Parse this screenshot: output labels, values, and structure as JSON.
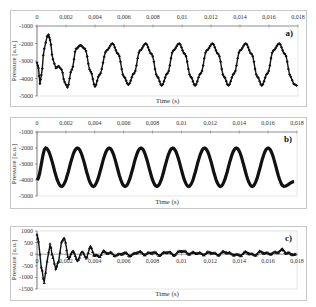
{
  "chart_data": [
    {
      "type": "line",
      "panel_label": "a)",
      "xlabel": "Time (s)",
      "ylabel": "Pressure [a.u.]",
      "xlim": [
        0,
        0.018
      ],
      "ylim": [
        -5000,
        -1000
      ],
      "x_ticks": [
        "0",
        "0,002",
        "0,004",
        "0,006",
        "0,008",
        "0,01",
        "0,012",
        "0,014",
        "0,016",
        "0,018"
      ],
      "y_ticks": [
        "-1000",
        "-2000",
        "-3000",
        "-4000",
        "-5000"
      ],
      "x_axis_position": "top",
      "grid": false,
      "marker": "diamond",
      "series": [
        {
          "name": "a",
          "x": [
            0,
            0.0001,
            0.0002,
            0.0003,
            0.0005,
            0.0007,
            0.0008,
            0.0009,
            0.0011,
            0.0013,
            0.0015,
            0.0017,
            0.0019,
            0.0021,
            0.0024,
            0.0027,
            0.003,
            0.0033,
            0.0037,
            0.004,
            0.0043,
            0.0048,
            0.0052,
            0.0056,
            0.006,
            0.0063,
            0.0067,
            0.0071,
            0.0075,
            0.0079,
            0.0083,
            0.0086,
            0.009,
            0.0094,
            0.0098,
            0.0102,
            0.0106,
            0.0109,
            0.0113,
            0.0117,
            0.0121,
            0.0125,
            0.0129,
            0.0132,
            0.0136,
            0.014,
            0.0144,
            0.0148,
            0.0152,
            0.0155,
            0.0159,
            0.0163,
            0.0167,
            0.0171,
            0.0175,
            0.0177,
            0.0179
          ],
          "y": [
            -3100,
            -3400,
            -4300,
            -3800,
            -2300,
            -1600,
            -1500,
            -1800,
            -2900,
            -3400,
            -3300,
            -3500,
            -4200,
            -4500,
            -3500,
            -2300,
            -2100,
            -2300,
            -3600,
            -4450,
            -3800,
            -2400,
            -2000,
            -2600,
            -3900,
            -4350,
            -3700,
            -2400,
            -2000,
            -2600,
            -3900,
            -4400,
            -3700,
            -2400,
            -2000,
            -2600,
            -3900,
            -4400,
            -3700,
            -2400,
            -2000,
            -2600,
            -3900,
            -4400,
            -3700,
            -2400,
            -2000,
            -2600,
            -3900,
            -4400,
            -3700,
            -2400,
            -2000,
            -2600,
            -3900,
            -4300,
            -4400
          ]
        }
      ]
    },
    {
      "type": "line",
      "panel_label": "b)",
      "xlabel": "Time (s)",
      "ylabel": "Pressure [a.u.]",
      "xlim": [
        0,
        0.018
      ],
      "ylim": [
        -5000,
        -1000
      ],
      "x_ticks": [
        "0",
        "0,002",
        "0,004",
        "0,006",
        "0,008",
        "0,01",
        "0,012",
        "0,014",
        "0,016",
        "0,018"
      ],
      "y_ticks": [
        "-1000",
        "-2000",
        "-3000",
        "-4000",
        "-5000"
      ],
      "x_axis_position": "top",
      "grid": false,
      "marker": "diamond",
      "series": [
        {
          "name": "b",
          "x": [
            0,
            0.0006,
            0.0017,
            0.0028,
            0.0039,
            0.005,
            0.0061,
            0.0072,
            0.0083,
            0.0094,
            0.0105,
            0.0116,
            0.0127,
            0.0138,
            0.0149,
            0.016,
            0.0171,
            0.0178
          ],
          "y": [
            -4000,
            -2000,
            -4400,
            -2000,
            -4400,
            -2000,
            -4400,
            -2000,
            -4400,
            -2000,
            -4400,
            -2000,
            -4400,
            -2000,
            -4400,
            -2000,
            -4400,
            -4100
          ]
        }
      ]
    },
    {
      "type": "line",
      "panel_label": "c)",
      "xlabel": "Time (s)",
      "ylabel": "Pressure [a.u.]",
      "xlim": [
        0,
        0.018
      ],
      "ylim": [
        -1500,
        1000
      ],
      "x_ticks": [
        "0",
        "0,002",
        "0,004",
        "0,006",
        "0,008",
        "0,01",
        "0,012",
        "0,014",
        "0,016",
        "0,018"
      ],
      "y_ticks": [
        "1000",
        "500",
        "0",
        "-500",
        "-1000",
        "-1500"
      ],
      "x_axis_position": "zero",
      "grid": false,
      "marker": "triangle",
      "series": [
        {
          "name": "c",
          "x": [
            0,
            0.0001,
            0.0003,
            0.0005,
            0.0007,
            0.0009,
            0.0011,
            0.0013,
            0.0015,
            0.0017,
            0.0019,
            0.0022,
            0.0025,
            0.0028,
            0.0031,
            0.0034,
            0.0037,
            0.004,
            0.0043,
            0.0046,
            0.005,
            0.0055,
            0.006,
            0.0065,
            0.007,
            0.0075,
            0.008,
            0.0085,
            0.009,
            0.0095,
            0.01,
            0.0105,
            0.011,
            0.0115,
            0.012,
            0.0125,
            0.013,
            0.0135,
            0.014,
            0.0145,
            0.015,
            0.0155,
            0.016,
            0.0165,
            0.017,
            0.0173,
            0.0176,
            0.0179
          ],
          "y": [
            850,
            600,
            -600,
            -1200,
            -300,
            400,
            -100,
            -650,
            -300,
            550,
            650,
            -200,
            150,
            -300,
            100,
            -150,
            300,
            -50,
            -100,
            100,
            50,
            -50,
            50,
            -50,
            100,
            0,
            80,
            -30,
            100,
            -20,
            150,
            30,
            60,
            0,
            80,
            -20,
            100,
            0,
            -50,
            80,
            -40,
            100,
            20,
            60,
            180,
            40,
            20,
            -50
          ]
        }
      ]
    }
  ],
  "panels": [
    {
      "label": "a)",
      "xlabel": "Time (s)",
      "ylabel": "Pressure [a.u.]"
    },
    {
      "label": "b)",
      "xlabel": "Time (s)",
      "ylabel": "Pressure [a.u.]"
    },
    {
      "label": "c)",
      "xlabel": "Time (s)",
      "ylabel": "Pressure [a.u.]"
    }
  ]
}
